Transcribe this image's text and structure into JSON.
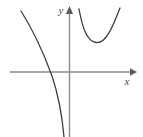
{
  "figure": {
    "title": "",
    "background_color": "#ffffff",
    "axis_color": "#8a8a8a",
    "curve_color": "#3f3f3f",
    "axes": {
      "x_axis": {
        "label": "x",
        "label_x": 127,
        "label_y": 85,
        "line": {
          "x1": 10,
          "y1": 72,
          "x2": 130,
          "y2": 72
        },
        "arrow": {
          "tip_x": 136,
          "tip_y": 72,
          "direction": "right"
        }
      },
      "y_axis": {
        "label": "y",
        "label_x": 61,
        "label_y": 14,
        "line": {
          "x1": 69.5,
          "y1": 14,
          "x2": 69.5,
          "y2": 137
        },
        "arrow": {
          "tip_x": 69.5,
          "tip_y": 7,
          "direction": "up"
        }
      },
      "origin": {
        "x": 69.5,
        "y": 72
      }
    }
  },
  "chart_data": {
    "type": "line",
    "title": "",
    "xlabel": "x",
    "ylabel": "y",
    "grid": false,
    "legend": null,
    "xlim": [
      10,
      136
    ],
    "ylim": [
      137,
      7
    ],
    "series": [
      {
        "name": "left-branch",
        "shape": "decreasing-asymptotic",
        "path": "M 21 11 C 33 30, 44 54, 52 76 C 58 94, 62 114, 64 137",
        "points": [
          {
            "x": 21,
            "y": 11
          },
          {
            "x": 34,
            "y": 33
          },
          {
            "x": 44,
            "y": 56
          },
          {
            "x": 49,
            "y": 68
          },
          {
            "x": 52,
            "y": 78
          },
          {
            "x": 58,
            "y": 100
          },
          {
            "x": 62,
            "y": 120
          },
          {
            "x": 64,
            "y": 137
          }
        ],
        "x_intercept": {
          "x": 49.5,
          "y": 72
        },
        "vertical_asymptote_x": 69.5
      },
      {
        "name": "right-branch",
        "shape": "u-shaped-minimum",
        "path": "M 79 9 C 82 25, 86 41, 96 42.5 C 106 44, 113 26, 120 8",
        "points": [
          {
            "x": 79,
            "y": 9
          },
          {
            "x": 83,
            "y": 27
          },
          {
            "x": 89,
            "y": 40
          },
          {
            "x": 96,
            "y": 42.5
          },
          {
            "x": 104,
            "y": 38
          },
          {
            "x": 112,
            "y": 24
          },
          {
            "x": 120,
            "y": 8
          }
        ],
        "minimum_point": {
          "x": 96,
          "y": 42.5
        },
        "vertical_asymptote_x": 69.5
      }
    ]
  }
}
